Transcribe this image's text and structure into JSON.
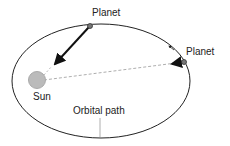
{
  "diagram": {
    "labels": {
      "planet_top": "Planet",
      "planet_right": "Planet",
      "sun": "Sun",
      "orbit": "Orbital path"
    },
    "colors": {
      "line": "#222222",
      "sun_fill": "#bbbbbb",
      "sun_stroke": "#999999",
      "planet_fill": "#777777",
      "dashed": "#999999"
    }
  }
}
